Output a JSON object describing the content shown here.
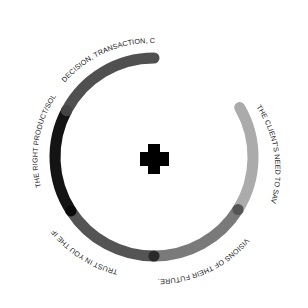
{
  "diagram": {
    "type": "segmented-ring",
    "center_icon": "plus-icon",
    "center": [
      154,
      157
    ],
    "radius": 99,
    "stroke_width": 11,
    "segments": [
      {
        "label": "DECISION, TRANSACTION, CLOSE.",
        "color": "#505050",
        "start_deg": -90,
        "end_deg": -152
      },
      {
        "label": "THE RIGHT PRODUCT/SOLUTION.",
        "color": "#141414",
        "start_deg": -152,
        "end_deg": -213
      },
      {
        "label": "TRUST IN YOU THE IFA.",
        "color": "#545454",
        "start_deg": 147,
        "end_deg": 90
      },
      {
        "label": "VISIONS OF THEIR FUTURE.",
        "color": "#7a7a7a",
        "start_deg": 90,
        "end_deg": 32
      },
      {
        "label": "THE CLIENT'S NEED TO SAVE.",
        "color": "#ababab",
        "start_deg": 32,
        "end_deg": -30
      }
    ]
  },
  "labels": {
    "decision": "DECISION, TRANSACTION, CLOSE.",
    "product": "THE RIGHT PRODUCT/SOLUTION.",
    "trust": "TRUST IN YOU THE IFA.",
    "visions": "VISIONS OF THEIR FUTURE.",
    "save": "THE CLIENT'S NEED TO SAVE."
  }
}
